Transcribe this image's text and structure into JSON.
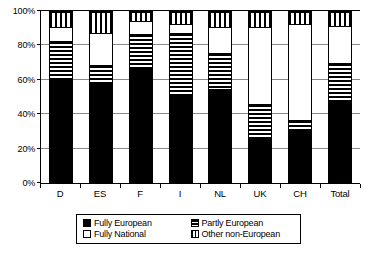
{
  "chart_data": {
    "type": "bar",
    "stacked": true,
    "stack_mode": "percent",
    "title": "",
    "xlabel": "",
    "ylabel": "",
    "ylim": [
      0,
      100
    ],
    "ytick_labels": [
      "0%",
      "20%",
      "40%",
      "60%",
      "80%",
      "100%"
    ],
    "ytick_values": [
      0,
      20,
      40,
      60,
      80,
      100
    ],
    "grid": true,
    "legend_position": "bottom",
    "categories": [
      "D",
      "ES",
      "F",
      "I",
      "NL",
      "UK",
      "CH",
      "Total"
    ],
    "series": [
      {
        "name": "Fully European",
        "pattern": "solid-black",
        "values": [
          60,
          58,
          67,
          51,
          55,
          26,
          31,
          48
        ]
      },
      {
        "name": "Partly European",
        "pattern": "horizontal-stripes",
        "values": [
          23,
          11,
          20,
          37,
          21,
          20,
          6,
          22
        ]
      },
      {
        "name": "Fully National",
        "pattern": "white",
        "values": [
          8,
          19,
          8,
          5,
          15,
          45,
          56,
          22
        ]
      },
      {
        "name": "Other non-European",
        "pattern": "vertical-stripes",
        "values": [
          9,
          12,
          5,
          7,
          9,
          9,
          7,
          8
        ]
      }
    ]
  },
  "legend": {
    "items": [
      {
        "label": "Fully European",
        "swatch": "solid-black-swatch"
      },
      {
        "label": "Partly European",
        "swatch": "horizontal-stripe-swatch"
      },
      {
        "label": "Fully National",
        "swatch": "white-swatch"
      },
      {
        "label": "Other non-European",
        "swatch": "vertical-stripe-swatch"
      }
    ]
  }
}
